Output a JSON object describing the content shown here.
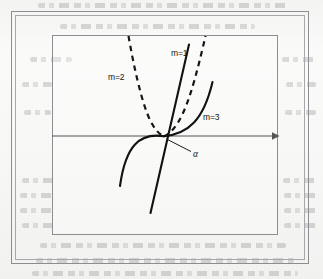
{
  "figure": {
    "type": "mathematical-plot",
    "background_color": "#f7f7f5",
    "ink_color": "#121212",
    "axis_color": "#55555a",
    "frame_color": "#8d8d90"
  },
  "axes": {
    "x_axis": {
      "label": "",
      "has_arrow": true,
      "arrow_direction": "right",
      "y_pixel": 136,
      "x_start": 52,
      "x_end": 278
    },
    "origin": {
      "x": 164,
      "y": 136
    }
  },
  "curves": [
    {
      "id": "m1",
      "label": "m=1",
      "style": "solid",
      "label_x": 172,
      "label_y": 51,
      "shape": "straight-line",
      "note": "linear, y = x, passes through origin with positive slope"
    },
    {
      "id": "m2",
      "label": "m=2",
      "style": "dashed",
      "label_x": 109,
      "label_y": 74,
      "shape": "parabola",
      "note": "even power, both branches rise above the axis from the origin"
    },
    {
      "id": "m3",
      "label": "m=3",
      "style": "solid",
      "label_x": 203,
      "label_y": 114,
      "shape": "cubic",
      "note": "odd power, odd symmetry about the origin"
    }
  ],
  "annotations": [
    {
      "id": "alpha",
      "label": "α",
      "label_x": 194,
      "label_y": 151,
      "leader_from": {
        "x": 190,
        "y": 150
      },
      "leader_to": {
        "x": 167,
        "y": 139
      },
      "note": "angle marked at the origin between the curves and the axis"
    }
  ],
  "background_text": {
    "visible": true,
    "legible": false,
    "note": "faint show-through of printed text from the reverse side of the scanned page"
  }
}
